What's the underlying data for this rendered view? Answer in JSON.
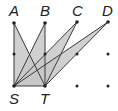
{
  "diagram": {
    "colors": {
      "fill": "#c8c8c8",
      "stroke": "#3a3a3a",
      "dot": "#222222"
    },
    "points": {
      "A": {
        "label": "A",
        "x": 14,
        "y": 23
      },
      "B": {
        "label": "B",
        "x": 45,
        "y": 23
      },
      "C": {
        "label": "C",
        "x": 77,
        "y": 22
      },
      "D": {
        "label": "D",
        "x": 108,
        "y": 22
      },
      "S": {
        "label": "S",
        "x": 14,
        "y": 86
      },
      "T": {
        "label": "T",
        "x": 45,
        "y": 86
      }
    },
    "grid_dots": [
      {
        "x": 14,
        "y": 54
      },
      {
        "x": 45,
        "y": 54
      },
      {
        "x": 77,
        "y": 54
      },
      {
        "x": 108,
        "y": 54
      },
      {
        "x": 77,
        "y": 86
      },
      {
        "x": 108,
        "y": 86
      }
    ],
    "triangles": [
      "SAT",
      "SBT",
      "SCT",
      "SDT"
    ]
  }
}
